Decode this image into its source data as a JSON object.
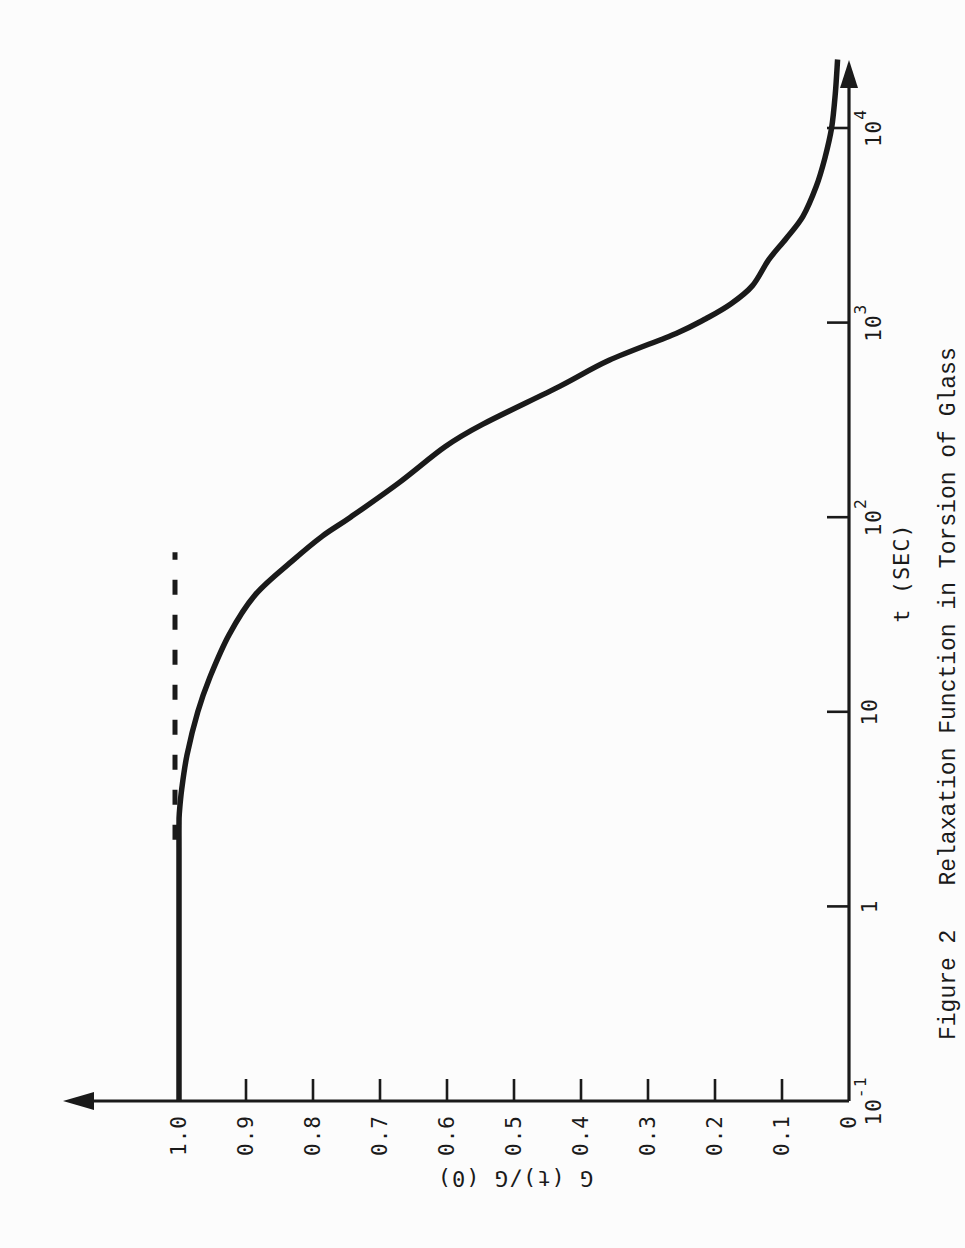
{
  "page": {
    "background": "#fcfcfc",
    "ink": "#1a1a1a"
  },
  "chart_data": {
    "type": "line",
    "figure_label": "Figure 2",
    "title": "Relaxation Function in Torsion of Glass",
    "xlabel": "t (SEC)",
    "ylabel": "G (t)/G (0)",
    "x_scale": "log",
    "xlim_log": [
      -1,
      4.34
    ],
    "ylim": [
      0,
      1.17
    ],
    "grid": "off",
    "axis_arrows": true,
    "x_ticks": [
      {
        "base": "10",
        "sup": "-1",
        "value": 0.1
      },
      {
        "base": "1",
        "sup": "",
        "value": 1
      },
      {
        "base": "10",
        "sup": "",
        "value": 10
      },
      {
        "base": "10",
        "sup": "2",
        "value": 100
      },
      {
        "base": "10",
        "sup": "3",
        "value": 1000
      },
      {
        "base": "10",
        "sup": "4",
        "value": 10000
      }
    ],
    "y_ticks": [
      {
        "label": "0",
        "value": 0
      },
      {
        "label": "0.1",
        "value": 0.1
      },
      {
        "label": "0.2",
        "value": 0.2
      },
      {
        "label": "0.3",
        "value": 0.3
      },
      {
        "label": "0.4",
        "value": 0.4
      },
      {
        "label": "0.5",
        "value": 0.5
      },
      {
        "label": "0.6",
        "value": 0.6
      },
      {
        "label": "0.7",
        "value": 0.7
      },
      {
        "label": "0.8",
        "value": 0.8
      },
      {
        "label": "0.9",
        "value": 0.9
      },
      {
        "label": "1.0",
        "value": 1.0
      }
    ],
    "series": [
      {
        "name": "relaxation-curve",
        "style": "solid",
        "stroke_width": 5.5,
        "points": [
          [
            0.1,
            1.0
          ],
          [
            0.6,
            1.0
          ],
          [
            1.2,
            1.0
          ],
          [
            2.0,
            1.0
          ],
          [
            2.6,
            1.0
          ],
          [
            3.0,
            0.9995
          ],
          [
            4,
            0.996
          ],
          [
            6,
            0.988
          ],
          [
            10,
            0.972
          ],
          [
            15,
            0.954
          ],
          [
            25,
            0.925
          ],
          [
            40,
            0.886
          ],
          [
            60,
            0.83
          ],
          [
            80,
            0.786
          ],
          [
            100,
            0.744
          ],
          [
            150,
            0.672
          ],
          [
            230,
            0.603
          ],
          [
            300,
            0.547
          ],
          [
            470,
            0.432
          ],
          [
            640,
            0.358
          ],
          [
            880,
            0.258
          ],
          [
            1050,
            0.213
          ],
          [
            1250,
            0.176
          ],
          [
            1550,
            0.144
          ],
          [
            2100,
            0.12
          ],
          [
            2700,
            0.094
          ],
          [
            3500,
            0.069
          ],
          [
            5000,
            0.049
          ],
          [
            7000,
            0.036
          ],
          [
            10000,
            0.026
          ],
          [
            15000,
            0.0205
          ],
          [
            22500,
            0.017
          ]
        ]
      },
      {
        "name": "unrelaxed-modulus-dashed-extension",
        "style": "dashed",
        "stroke_width": 5,
        "dash": [
          15,
          20
        ],
        "points": [
          [
            2.2,
            1.006
          ],
          [
            66,
            1.006
          ]
        ]
      }
    ]
  }
}
